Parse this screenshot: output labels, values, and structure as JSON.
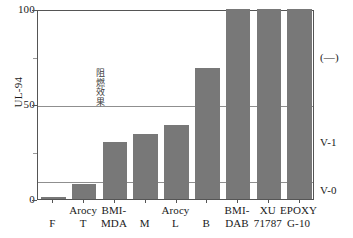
{
  "chart_data": {
    "type": "bar",
    "title": "",
    "subtitle": "",
    "xlabel": "",
    "ylabel": "UL-94",
    "ylim": [
      0,
      100
    ],
    "yticks": [
      0,
      50,
      100
    ],
    "ytick_labels": [
      "0",
      "50",
      "100"
    ],
    "y_minor_ticks": [
      25,
      75
    ],
    "grid": true,
    "gridlines": [
      10,
      50
    ],
    "legend": "none",
    "bar_color": "#787878",
    "categories": [
      "F",
      "Arocy T",
      "BMI-MDA",
      "M",
      "Arocy L",
      "B",
      "BMI-DAB",
      "XU 71787",
      "EPOXY G-10"
    ],
    "category_lines": [
      {
        "line1": "",
        "line2": "F"
      },
      {
        "line1": "Arocy",
        "line2": "T"
      },
      {
        "line1": "BMI-",
        "line2": "MDA"
      },
      {
        "line1": "",
        "line2": "M"
      },
      {
        "line1": "Arocy",
        "line2": "L"
      },
      {
        "line1": "",
        "line2": "B"
      },
      {
        "line1": "BMI-",
        "line2": "DAB"
      },
      {
        "line1": "XU",
        "line2": "71787"
      },
      {
        "line1": "EPOXY",
        "line2": "G-10"
      }
    ],
    "values": [
      1,
      8,
      30,
      34,
      39,
      69,
      100,
      100,
      100
    ],
    "annotations": {
      "in_plot_vertical": "阻燃效果",
      "in_plot_vertical_chars": [
        "阻",
        "燃",
        "效",
        "果"
      ]
    },
    "secondary_axis": {
      "position": "right",
      "label": "UL-94 rating",
      "bands": [
        {
          "label": "V-0",
          "from": 0,
          "to": 10
        },
        {
          "label": "V-1",
          "from": 10,
          "to": 50
        },
        {
          "label": "(—)",
          "from": 50,
          "to": 100
        }
      ]
    }
  }
}
